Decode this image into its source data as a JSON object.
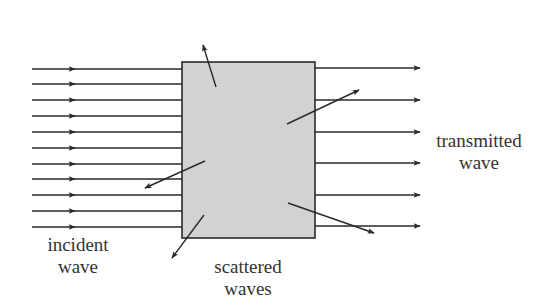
{
  "diagram": {
    "colors": {
      "line": "#2a2a2a",
      "box_fill": "#d2d2d2",
      "box_stroke": "#2a2a2a",
      "text": "#333333"
    },
    "labels": {
      "incident": [
        "incident",
        "wave"
      ],
      "scattered": [
        "scattered",
        "waves"
      ],
      "transmitted": [
        "transmitted",
        "wave"
      ]
    },
    "scatterer_box": {
      "x": 182,
      "y": 62,
      "width": 133,
      "height": 176
    },
    "incident_rays": {
      "x_start": 32,
      "x_end": 182,
      "arrow_x": 75,
      "ys": [
        69,
        84,
        100,
        116,
        132,
        148,
        164,
        179,
        195,
        211,
        227
      ]
    },
    "transmitted_rays": {
      "x_start": 315,
      "x_end": 420,
      "ys": [
        68,
        100,
        132,
        163,
        195,
        226
      ]
    },
    "scattered_rays": [
      {
        "x1": 216,
        "y1": 87,
        "x2": 203,
        "y2": 45
      },
      {
        "x1": 287,
        "y1": 124,
        "x2": 359,
        "y2": 90
      },
      {
        "x1": 205,
        "y1": 161,
        "x2": 145,
        "y2": 188
      },
      {
        "x1": 288,
        "y1": 203,
        "x2": 374,
        "y2": 233
      },
      {
        "x1": 204,
        "y1": 215,
        "x2": 172,
        "y2": 258
      }
    ]
  }
}
